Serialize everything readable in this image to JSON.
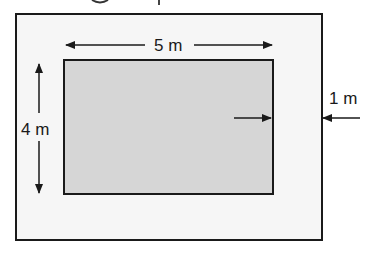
{
  "diagram": {
    "type": "garden-with-border",
    "outer_rect": {
      "stroke": "#1a1a1a",
      "fill": "#f6f6f6"
    },
    "inner_rect": {
      "stroke": "#1a1a1a",
      "fill": "#d6d6d6"
    },
    "dimensions": {
      "width_label": "5 m",
      "height_label": "4 m",
      "border_label": "1 m"
    }
  }
}
